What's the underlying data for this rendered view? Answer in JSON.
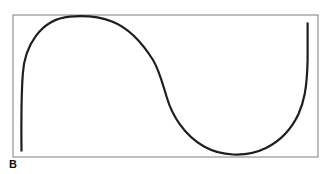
{
  "figure": {
    "panel_label": "B"
  },
  "frame": {
    "x": "13",
    "y": "15",
    "width": "305",
    "height": "142",
    "stroke_width": "1"
  },
  "curve": {
    "path": "M 21.5 151.5 C 21.2 122 21.2 96 22.8 74 C 24.4 47 40 19 70 16.6 C 88 15.2 100 16.8 112 21.5 C 130 28.5 143 44 153 60 C 159 69.5 162 82 167 98 C 172 115 184 135 204 146.5 C 220 155.5 245 158.3 266 148 C 282 140 292 128 298.5 114 C 303.5 102.5 307 90 307.6 60 L 307.6 22.5",
    "stroke_width": "2.2"
  },
  "colors": {
    "curve": "#1e1e1e",
    "frame": "#7d7d7d",
    "background": "#ffffff",
    "label": "#111111"
  }
}
